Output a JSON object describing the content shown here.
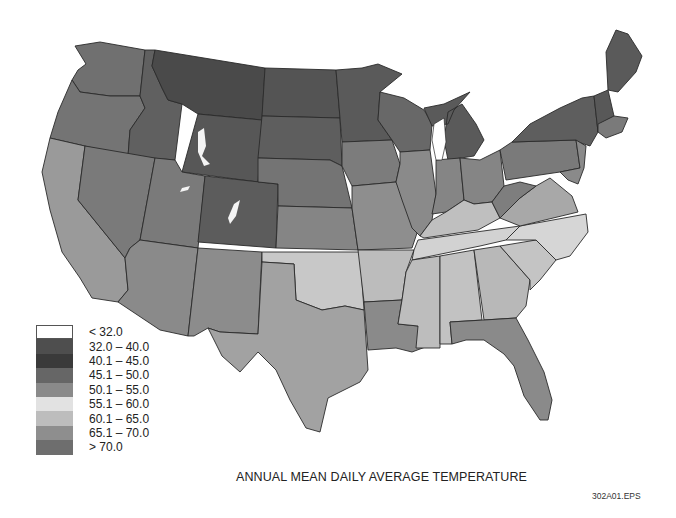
{
  "map": {
    "title": "ANNUAL MEAN DAILY AVERAGE TEMPERATURE",
    "file_code": "302A01.EPS",
    "region": "Contiguous United States",
    "style": "grayscale choropleth with state boundaries"
  },
  "legend": {
    "items": [
      {
        "label": "< 32.0",
        "color": "#ffffff"
      },
      {
        "label": "32.0 – 40.0",
        "color": "#4e4e4e"
      },
      {
        "label": "40.1 – 45.0",
        "color": "#3a3a3a"
      },
      {
        "label": "45.1 – 50.0",
        "color": "#666666"
      },
      {
        "label": "50.1 – 55.0",
        "color": "#8a8a8a"
      },
      {
        "label": "55.1 – 60.0",
        "color": "#e2e2e2"
      },
      {
        "label": "60.1 – 65.0",
        "color": "#bdbdbd"
      },
      {
        "label": "65.1 – 70.0",
        "color": "#8e8e8e"
      },
      {
        "label": "> 70.0",
        "color": "#6e6e6e"
      }
    ]
  },
  "colors": {
    "border": "#2a2a2a",
    "background": "#ffffff"
  }
}
